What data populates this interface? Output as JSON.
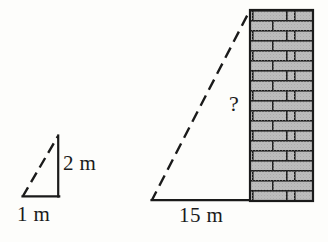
{
  "figure": {
    "background_color": "#fdfdfb",
    "ink_color": "#1a1a1a",
    "brick_fill_color": "#bdbdbd",
    "brick_mortar_color": "#1a1a1a",
    "small_triangle": {
      "name": "small-right-triangle",
      "height_label": "2 m",
      "base_label": "1 m",
      "apex": [
        58,
        136
      ],
      "base_left": [
        23,
        196
      ],
      "base_right": [
        58,
        196
      ],
      "hypotenuse_style": "dashed",
      "leg_style": "solid"
    },
    "large_triangle": {
      "name": "large-right-triangle-with-wall",
      "base_label": "15 m",
      "height_label": "?",
      "apex": [
        250,
        10
      ],
      "base_left": [
        152,
        200
      ],
      "base_right": [
        250,
        200
      ],
      "hypotenuse_style": "dashed",
      "leg_style": "solid"
    },
    "brick_wall": {
      "name": "brick-wall",
      "left": 250,
      "top": 10,
      "right": 313,
      "bottom": 201,
      "rows": 19,
      "row_height": 10,
      "bricks_per_row": 3
    }
  }
}
